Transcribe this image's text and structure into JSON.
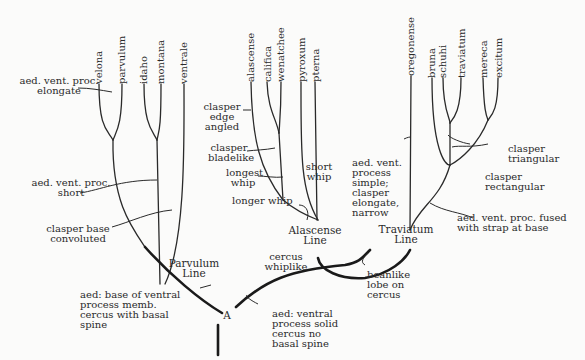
{
  "taxa": {
    "velona": "velona",
    "parvulum": "parvulum",
    "idaho": "idaho",
    "montana": "montana",
    "ventrale": "ventrale",
    "alascense": "alascense",
    "califica": "califica",
    "wenatchee": "wenatchee",
    "pyroxum": "pyroxum",
    "pterna": "pterna",
    "oregonense": "oregonense",
    "bruna": "bruna",
    "schuhi": "schuhi",
    "traviatum": "traviatum",
    "mereca": "mereca",
    "excitum": "excitum"
  },
  "lines": {
    "parvulum": "Parvulum\nLine",
    "alascense": "Alascense\nLine",
    "traviatum": "Traviatum\nLine",
    "root": "A"
  },
  "annotations": {
    "aed_vent_elongate": "aed. vent. proc.\nelongate",
    "aed_vent_short": "aed. vent. proc.\nshort",
    "clasper_base": "clasper base\nconvoluted",
    "clasper_edge": "clasper\nedge\nangled",
    "clasper_bladelike": "clasper\nbladelike",
    "longest_whip": "longest\nwhip",
    "longer_whip": "longer whip",
    "short_whip": "short\nwhip",
    "aed_vent_simple": "aed. vent.\nprocess\nsimple;\nclasper\nelongate,\nnarrow",
    "clasper_triangular": "clasper\ntriangular",
    "clasper_rectangular": "clasper\nrectangular",
    "aed_vent_fused": "aed. vent. proc. fused\nwith strap at base",
    "cercus_whiplike": "cercus\nwhiplike",
    "beanlike": "beanlike\nlobe on\ncercus",
    "aed_base_memb": "aed: base of ventral\nprocess memb.\ncercus with basal\nspine",
    "aed_ventral_solid": "aed: ventral\nprocess solid\ncercus no\nbasal spine"
  },
  "colors": {
    "ink": "#2a2a2a",
    "paper": "#fbfbfa"
  }
}
